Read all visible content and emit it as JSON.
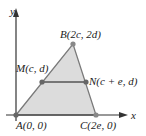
{
  "axes": {
    "x_label": "x",
    "y_label": "y"
  },
  "points": {
    "A": {
      "label": "A(0, 0)"
    },
    "B": {
      "label": "B(2c, 2d)"
    },
    "C": {
      "label": "C(2e, 0)"
    },
    "M": {
      "label": "M(c, d)"
    },
    "N": {
      "label": "N(c + e, d)"
    }
  },
  "colors": {
    "fill": "#d9d9d9",
    "stroke": "#777777",
    "point": "#666666",
    "segment": "#555555"
  }
}
